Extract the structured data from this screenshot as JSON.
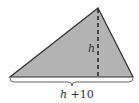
{
  "figure": {
    "shape": "triangle",
    "fill_color": "#b3b3b3",
    "stroke_color": "#333333",
    "vertices": {
      "apex": [
        98,
        8
      ],
      "base_left": [
        10,
        77
      ],
      "base_right": [
        133,
        77
      ]
    },
    "height_line": {
      "style": "dashed",
      "label": "h"
    },
    "base_brace": {
      "label_var": "h",
      "label_rest": " +10"
    }
  }
}
